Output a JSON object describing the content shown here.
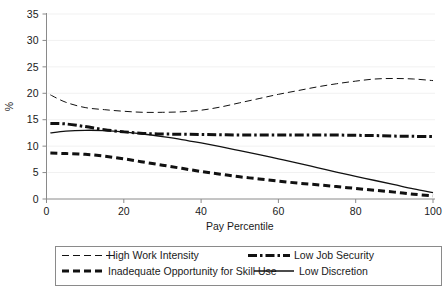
{
  "chart_data": {
    "type": "line",
    "title": "",
    "xlabel": "Pay Percentile",
    "ylabel": "%",
    "xlim": [
      0,
      100
    ],
    "ylim": [
      0,
      35
    ],
    "grid": true,
    "legend_position": "bottom",
    "x_ticks": [
      "0",
      "20",
      "40",
      "60",
      "80",
      "100"
    ],
    "x_tick_values": [
      0,
      20,
      40,
      60,
      80,
      100
    ],
    "y_ticks": [
      "0",
      "5",
      "10",
      "15",
      "20",
      "25",
      "30",
      "35"
    ],
    "y_tick_values": [
      0,
      5,
      10,
      15,
      20,
      25,
      30,
      35
    ],
    "x": [
      1,
      5,
      10,
      15,
      20,
      25,
      30,
      35,
      40,
      45,
      50,
      55,
      60,
      65,
      70,
      75,
      80,
      85,
      90,
      95,
      100
    ],
    "series": [
      {
        "name": "High Work Intensity",
        "style": "long-dash-thin",
        "color": "#111111",
        "width": 1.0,
        "dash": "7,4",
        "values": [
          19.7,
          18.3,
          17.3,
          16.9,
          16.6,
          16.4,
          16.4,
          16.5,
          16.8,
          17.4,
          18.2,
          19.0,
          19.8,
          20.5,
          21.2,
          21.8,
          22.3,
          22.7,
          22.8,
          22.7,
          22.4
        ]
      },
      {
        "name": "Low Job Security",
        "style": "dash-dot-thick",
        "color": "#111111",
        "width": 3.0,
        "dash": "9,3,2.5,3",
        "values": [
          14.3,
          14.2,
          13.7,
          13.1,
          12.7,
          12.4,
          12.3,
          12.25,
          12.2,
          12.15,
          12.1,
          12.1,
          12.1,
          12.1,
          12.1,
          12.1,
          12.05,
          12.0,
          11.9,
          11.85,
          11.8
        ]
      },
      {
        "name": "Inadequate Opportunity for Skill Use",
        "style": "dash-thick",
        "color": "#111111",
        "width": 3.0,
        "dash": "7,4",
        "values": [
          8.7,
          8.6,
          8.45,
          8.1,
          7.6,
          7.0,
          6.4,
          5.8,
          5.2,
          4.7,
          4.2,
          3.8,
          3.4,
          3.0,
          2.7,
          2.35,
          2.0,
          1.65,
          1.3,
          0.9,
          0.6
        ]
      },
      {
        "name": "Low Discretion",
        "style": "solid-thin",
        "color": "#111111",
        "width": 1.3,
        "dash": "none",
        "values": [
          12.5,
          12.85,
          13.0,
          12.95,
          12.7,
          12.3,
          11.8,
          11.25,
          10.6,
          9.9,
          9.15,
          8.4,
          7.6,
          6.8,
          5.95,
          5.1,
          4.3,
          3.5,
          2.7,
          1.9,
          1.2
        ]
      }
    ],
    "legend": [
      {
        "label": "High Work Intensity",
        "style": "long-dash-thin"
      },
      {
        "label": "Low Job Security",
        "style": "dash-dot-thick"
      },
      {
        "label": "Inadequate Opportunity for Skill Use",
        "style": "dash-thick"
      },
      {
        "label": "Low Discretion",
        "style": "solid-thin"
      }
    ]
  }
}
